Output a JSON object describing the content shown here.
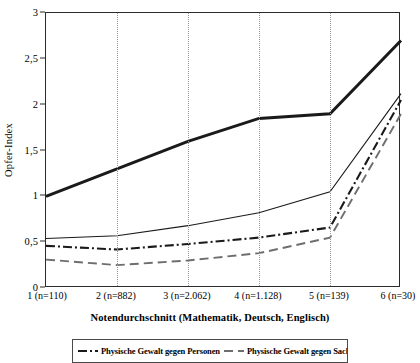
{
  "chart_data": {
    "type": "line",
    "title": "",
    "xlabel": "Notendurchschnitt (Mathematik, Deutsch, Englisch)",
    "ylabel": "Opfer-Index",
    "categories": [
      "1 (n=110)",
      "2 (n=882)",
      "3 (n=2.062)",
      "4 (n=1.128)",
      "5 (n=139)",
      "6 (n=30)"
    ],
    "x": [
      1,
      2,
      3,
      4,
      5,
      6
    ],
    "ylim": [
      0,
      3
    ],
    "yticks": [
      0,
      0.5,
      1,
      1.5,
      2,
      2.5,
      3
    ],
    "ytick_labels": [
      "0",
      "0,5",
      "1",
      "1,5",
      "2",
      "2,5",
      "3"
    ],
    "grid": "vertical-dotted",
    "legend_position": "bottom",
    "series": [
      {
        "name": "Verbale Gewalt",
        "style": "thick-solid",
        "color": "#1a1a1a",
        "values": [
          1.0,
          1.3,
          1.6,
          1.85,
          1.9,
          2.7
        ]
      },
      {
        "name": "Psychische Gewalt",
        "style": "thin-solid",
        "color": "#1a1a1a",
        "values": [
          0.54,
          0.57,
          0.68,
          0.82,
          1.05,
          2.12
        ]
      },
      {
        "name": "Physische Gewalt gegen Personen",
        "style": "dash-dot",
        "color": "#1a1a1a",
        "values": [
          0.46,
          0.42,
          0.48,
          0.55,
          0.66,
          2.05
        ]
      },
      {
        "name": "Physische Gewalt gegen Sachen",
        "style": "long-dash",
        "color": "#6e6e6e",
        "values": [
          0.31,
          0.25,
          0.3,
          0.38,
          0.55,
          1.9
        ]
      }
    ],
    "legend_entries": [
      {
        "label": "Physische Gewalt gegen Personen",
        "style": "dash-dot",
        "color": "#1a1a1a"
      },
      {
        "label": "Physische Gewalt gegen Sachen",
        "style": "long-dash",
        "color": "#6e6e6e"
      }
    ]
  }
}
